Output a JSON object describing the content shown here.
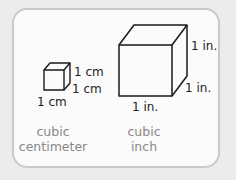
{
  "cubes": [
    {
      "name": "cubic centimeter",
      "labels": {
        "height": "1 cm",
        "depth": "1 cm",
        "width": "1 cm"
      },
      "caption": {
        "line1": "cubic",
        "line2": "centimeter"
      }
    },
    {
      "name": "cubic inch",
      "labels": {
        "height": "1 in.",
        "depth": "1 in.",
        "width": "1 in."
      },
      "caption": {
        "line1": "cubic",
        "line2": "inch"
      }
    }
  ]
}
